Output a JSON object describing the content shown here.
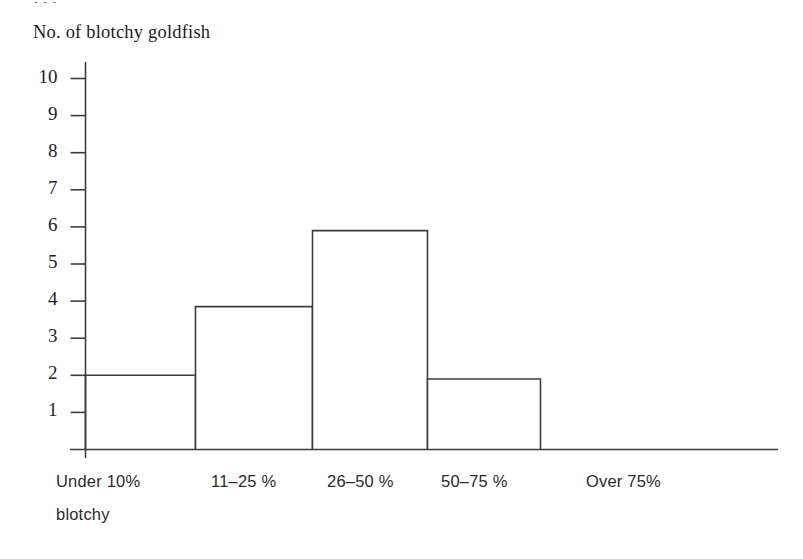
{
  "clipped_top_text": ". . .",
  "axis_title": "No. of blotchy goldfish",
  "x_sublabel": "blotchy",
  "colors": {
    "line": "#3d3d3d",
    "bar_fill": "#ffffff",
    "text": "#1f1f1f",
    "background": "#ffffff"
  },
  "chart_data": {
    "type": "bar",
    "title": "",
    "subtitle": "",
    "xlabel": "",
    "ylabel": "No. of blotchy goldfish",
    "categories": [
      "Under 10%",
      "11–25 %",
      "26–50 %",
      "50–75 %",
      "Over 75%"
    ],
    "values": [
      2,
      3.85,
      5.9,
      1.9,
      0
    ],
    "ylim": [
      0,
      10
    ],
    "yticks": [
      1,
      2,
      3,
      4,
      5,
      6,
      7,
      8,
      9,
      10
    ],
    "ytick_labels": [
      "1",
      "2",
      "3",
      "4",
      "5",
      "6",
      "7",
      "8",
      "9",
      "10"
    ],
    "grid": false,
    "legend": false,
    "bar_gap": 0,
    "note": "Histogram style: contiguous outlined bars, last category empty."
  }
}
